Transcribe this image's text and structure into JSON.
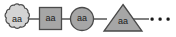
{
  "diagram": {
    "background_color": "#ffffff",
    "line_color": "#4a4a4a",
    "text_color": "#1a1a1a",
    "nodes": [
      {
        "id": "node-1",
        "shape": "cloud",
        "label": "aa",
        "fill": "#d4d4d4",
        "stroke": "#9a9a9a",
        "cx": 16,
        "cy": 19
      },
      {
        "id": "node-2",
        "shape": "square",
        "label": "aa",
        "fill": "#a6a6a6",
        "stroke": "#4a4a4a",
        "cx": 50,
        "cy": 19
      },
      {
        "id": "node-3",
        "shape": "circle",
        "label": "aa",
        "fill": "#a6a6a6",
        "stroke": "#4a4a4a",
        "cx": 82,
        "cy": 19
      },
      {
        "id": "node-4",
        "shape": "triangle",
        "label": "aa",
        "fill": "#a6a6a6",
        "stroke": "#4a4a4a",
        "cx": 123,
        "cy": 19
      }
    ],
    "connectors": [
      {
        "id": "connector-1",
        "from": "node-1",
        "to": "node-2",
        "x1": 30,
        "x2": 39,
        "y": 19
      },
      {
        "id": "connector-2",
        "from": "node-2",
        "to": "node-3",
        "x1": 61,
        "x2": 70,
        "y": 19
      },
      {
        "id": "connector-3",
        "from": "node-3",
        "to": "node-4",
        "x1": 94,
        "x2": 106,
        "y": 19
      },
      {
        "id": "connector-4",
        "from": "node-4",
        "to": "ellipsis",
        "x1": 131,
        "x2": 149,
        "y": 19
      }
    ],
    "ellipsis": {
      "label": "• • •",
      "dot_color": "#1a1a1a",
      "dot_size": 3,
      "dots": [
        {
          "cx": 152,
          "cy": 19
        },
        {
          "cx": 160,
          "cy": 19
        },
        {
          "cx": 168,
          "cy": 19
        }
      ]
    }
  }
}
